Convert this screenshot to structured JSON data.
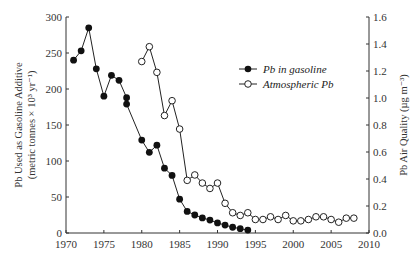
{
  "chart_data": {
    "type": "line",
    "title": "",
    "xlabel": "",
    "ylabel_left": "Pb Used as Gasoline Additive",
    "ylabel_left_sub": "(metric tonnes × 10³ yr⁻¹)",
    "ylabel_right": "Pb Air Quality (µg m⁻³)",
    "xlim": [
      1970,
      2010
    ],
    "ylim_left": [
      0,
      300
    ],
    "ylim_right": [
      0,
      1.6
    ],
    "grid": false,
    "legend_position": "upper right (inside)",
    "x_ticks": [
      "1970",
      "1975",
      "1980",
      "1985",
      "1990",
      "1995",
      "2000",
      "2005",
      "2010"
    ],
    "y_left_ticks": [
      "0",
      "50",
      "100",
      "150",
      "200",
      "250",
      "300"
    ],
    "y_right_ticks": [
      "0.0",
      "0.2",
      "0.4",
      "0.6",
      "0.8",
      "1.0",
      "1.2",
      "1.4",
      "1.6"
    ],
    "series": [
      {
        "name": "Pb in gasoline",
        "axis": "left",
        "marker": "filled-circle",
        "x": [
          1971,
          1972,
          1973,
          1974,
          1975,
          1976,
          1977,
          1978,
          1978,
          1980,
          1981,
          1982,
          1983,
          1984,
          1985,
          1986,
          1987,
          1988,
          1989,
          1990,
          1991,
          1992,
          1993,
          1994
        ],
        "values": [
          240,
          253,
          285,
          228,
          190,
          219,
          212,
          188,
          179,
          129,
          112,
          122,
          90,
          80,
          47,
          30,
          25,
          21,
          18,
          14,
          11,
          8,
          6,
          4
        ]
      },
      {
        "name": "Atmospheric Pb",
        "axis": "right",
        "marker": "open-circle",
        "x": [
          1980,
          1981,
          1982,
          1983,
          1984,
          1985,
          1986,
          1987,
          1988,
          1989,
          1990,
          1991,
          1992,
          1993,
          1994,
          1995,
          1996,
          1997,
          1998,
          1999,
          2000,
          2001,
          2002,
          2003,
          2004,
          2005,
          2006,
          2007,
          2008
        ],
        "values": [
          1.27,
          1.38,
          1.19,
          0.87,
          0.98,
          0.77,
          0.39,
          0.43,
          0.37,
          0.33,
          0.37,
          0.22,
          0.15,
          0.13,
          0.15,
          0.1,
          0.1,
          0.12,
          0.1,
          0.13,
          0.09,
          0.09,
          0.1,
          0.12,
          0.12,
          0.1,
          0.08,
          0.11,
          0.11
        ]
      }
    ]
  },
  "legend": {
    "items": [
      {
        "label": "Pb in gasoline"
      },
      {
        "label": "Atmospheric Pb"
      }
    ]
  }
}
